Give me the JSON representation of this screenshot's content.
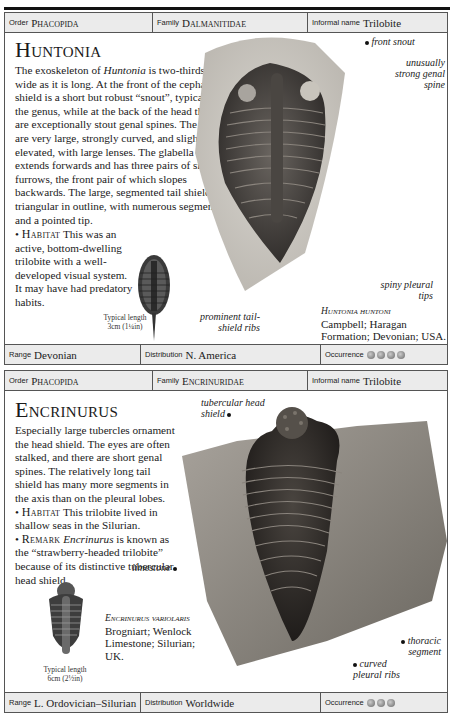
{
  "entries": [
    {
      "order_label": "Order",
      "order": "Phacopida",
      "family_label": "Family",
      "family": "Dalmanitidae",
      "informal_label": "Informal name",
      "informal": "Trilobite",
      "title": "Huntonia",
      "description_parts": {
        "p1": "The exoskeleton of ",
        "genus": "Huntonia",
        "p2": " is two-thirds as wide as it is long. At the front of the cephalic shield is a short but robust “snout”, typical of the genus, while at the back of the head there are exceptionally stout genal spines. The eyes are very large, strongly curved, and slightly elevated, with large lenses. The glabella extends forwards and has three pairs of side furrows, the front pair of which slopes backwards. The large, segmented tail shield is triangular in outline, with numerous segments and a pointed tip."
      },
      "habitat_label": "Habitat",
      "habitat": "This was an active, bottom-dwelling trilobite with a well-developed visual system. It may have had predatory habits.",
      "typical_length_label": "Typical length",
      "typical_length": "3cm (1¼in)",
      "annotations": [
        "front snout",
        "unusually strong genal spine",
        "spiny pleural tips",
        "prominent tail-shield ribs"
      ],
      "specimen_name": "Huntonia huntoni",
      "specimen_details": "Campbell; Haragan Formation; Devonian; USA.",
      "range_label": "Range",
      "range": "Devonian",
      "distribution_label": "Distribution",
      "distribution": "N. America",
      "occurrence_label": "Occurrence",
      "occurrence_count": 4
    },
    {
      "order_label": "Order",
      "order": "Phacopida",
      "family_label": "Family",
      "family": "Encrinuridae",
      "informal_label": "Informal name",
      "informal": "Trilobite",
      "title": "Encrinurus",
      "description": "Especially large tubercles ornament the head shield. The eyes are often stalked, and there are short genal spines. The relatively long tail shield has many more segments in the axis than on the pleural lobes.",
      "habitat_label": "Habitat",
      "habitat": "This trilobite lived in shallow seas in the Silurian.",
      "remark_label": "Remark",
      "remark_genus": "Encrinurus",
      "remark": " is known as the “strawberry-headed trilobite” because of its distinctive tubercular head shield.",
      "typical_length_label": "Typical length",
      "typical_length": "6cm (2½in)",
      "annotations": [
        "tubercular head shield",
        "limestone",
        "thoracic segment",
        "curved pleural ribs"
      ],
      "specimen_name": "Encrinurus variolaris",
      "specimen_details": "Brogniart; Wenlock Limestone; Silurian; UK.",
      "range_label": "Range",
      "range": "L. Ordovician–Silurian",
      "distribution_label": "Distribution",
      "distribution": "Worldwide",
      "occurrence_label": "Occurrence",
      "occurrence_count": 3
    }
  ]
}
